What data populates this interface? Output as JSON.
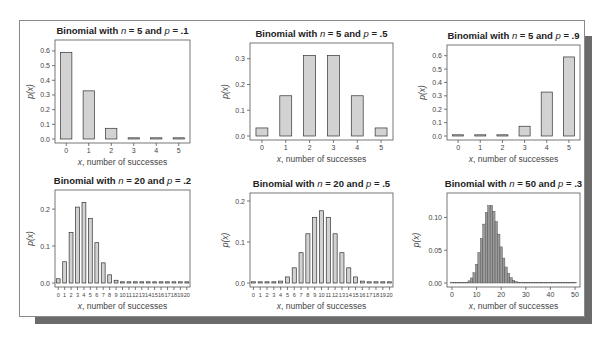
{
  "figure": {
    "frame_color": "#8a8a8a",
    "shadow_color": "#6b6b6b",
    "bar_fill": "#d2d2d2",
    "bar_stroke": "#333333"
  },
  "chart_data": [
    {
      "type": "bar",
      "title_prefix": "Binomial with ",
      "n": "20",
      "p": ".2",
      "title": "Binomial with n = 5 and p = .1",
      "title_parts": {
        "n": "5",
        "p": ".1"
      },
      "xlabel": "x, number of successes",
      "ylabel": "p(x)",
      "categories": [
        "0",
        "1",
        "2",
        "3",
        "4",
        "5"
      ],
      "values": [
        0.5905,
        0.3281,
        0.0729,
        0.0081,
        0.0005,
        0.0
      ],
      "yticks": [
        "0.0",
        "0.1",
        "0.2",
        "0.3",
        "0.4",
        "0.5",
        "0.6"
      ],
      "ylim": [
        0,
        0.62
      ],
      "grid": false
    },
    {
      "type": "bar",
      "title": "Binomial with n = 5 and p = .5",
      "title_parts": {
        "n": "5",
        "p": ".5"
      },
      "xlabel": "x, number of successes",
      "ylabel": "p(x)",
      "categories": [
        "0",
        "1",
        "2",
        "3",
        "4",
        "5"
      ],
      "values": [
        0.03125,
        0.15625,
        0.3125,
        0.3125,
        0.15625,
        0.03125
      ],
      "yticks": [
        "0.0",
        "0.1",
        "0.2",
        "0.3"
      ],
      "ylim": [
        0,
        0.33
      ],
      "grid": false
    },
    {
      "type": "bar",
      "title": "Binomial with n = 5 and p = .9",
      "title_parts": {
        "n": "5",
        "p": ".9"
      },
      "xlabel": "x, number of successes",
      "ylabel": "p(x)",
      "categories": [
        "0",
        "1",
        "2",
        "3",
        "4",
        "5"
      ],
      "values": [
        0.0,
        0.0005,
        0.0081,
        0.0729,
        0.3281,
        0.5905
      ],
      "yticks": [
        "0.0",
        "0.1",
        "0.2",
        "0.3",
        "0.4",
        "0.5",
        "0.6"
      ],
      "ylim": [
        0,
        0.62
      ],
      "grid": false
    },
    {
      "type": "bar",
      "title": "Binomial with n = 20 and p = .2",
      "title_parts": {
        "n": "20",
        "p": ".2"
      },
      "xlabel": "x, number of successes",
      "ylabel": "p(x)",
      "categories": [
        "0",
        "1",
        "2",
        "3",
        "4",
        "5",
        "6",
        "7",
        "8",
        "9",
        "10",
        "11",
        "12",
        "13",
        "14",
        "15",
        "16",
        "17",
        "18",
        "19",
        "20"
      ],
      "values": [
        0.0115,
        0.0576,
        0.1369,
        0.2054,
        0.2182,
        0.1746,
        0.1091,
        0.0545,
        0.0222,
        0.0074,
        0.002,
        0.0005,
        0.0001,
        0,
        0,
        0,
        0,
        0,
        0,
        0,
        0
      ],
      "yticks": [
        "0.0",
        "0.1",
        "0.2"
      ],
      "ylim": [
        0,
        0.23
      ],
      "grid": false
    },
    {
      "type": "bar",
      "title": "Binomial with n = 20 and p = .5",
      "title_parts": {
        "n": "20",
        "p": ".5"
      },
      "xlabel": "x, number of successes",
      "ylabel": "p(x)",
      "categories": [
        "0",
        "1",
        "2",
        "3",
        "4",
        "5",
        "6",
        "7",
        "8",
        "9",
        "10",
        "11",
        "12",
        "13",
        "14",
        "15",
        "16",
        "17",
        "18",
        "19",
        "20"
      ],
      "values": [
        0.0,
        0.0,
        0.0002,
        0.0011,
        0.0046,
        0.0148,
        0.037,
        0.0739,
        0.1201,
        0.1602,
        0.1762,
        0.1602,
        0.1201,
        0.0739,
        0.037,
        0.0148,
        0.0046,
        0.0011,
        0.0002,
        0.0,
        0.0
      ],
      "yticks": [
        "0.0",
        "0.1",
        "0.2"
      ],
      "ylim": [
        0,
        0.2
      ],
      "grid": false
    },
    {
      "type": "bar",
      "title": "Binomial with n = 50 and p = .3",
      "title_parts": {
        "n": "50",
        "p": ".3"
      },
      "xlabel": "x, number of successes",
      "ylabel": "p(x)",
      "x_range": [
        0,
        50
      ],
      "xticks": [
        "0",
        "10",
        "20",
        "30",
        "40",
        "50"
      ],
      "values": [
        0.0,
        0.0,
        0.0,
        0.0,
        0.0001,
        0.0004,
        0.0012,
        0.0033,
        0.0077,
        0.0157,
        0.0286,
        0.0465,
        0.0679,
        0.0898,
        0.1077,
        0.1178,
        0.1184,
        0.1094,
        0.0937,
        0.0745,
        0.0551,
        0.038,
        0.0244,
        0.0146,
        0.0082,
        0.0043,
        0.0021,
        0.001,
        0.0004,
        0.0002,
        0.0001,
        0,
        0,
        0,
        0,
        0,
        0,
        0,
        0,
        0,
        0,
        0,
        0,
        0,
        0,
        0,
        0,
        0,
        0,
        0,
        0
      ],
      "yticks": [
        "0.00",
        "0.05",
        "0.10"
      ],
      "ylim": [
        0,
        0.125
      ],
      "grid": false
    }
  ]
}
